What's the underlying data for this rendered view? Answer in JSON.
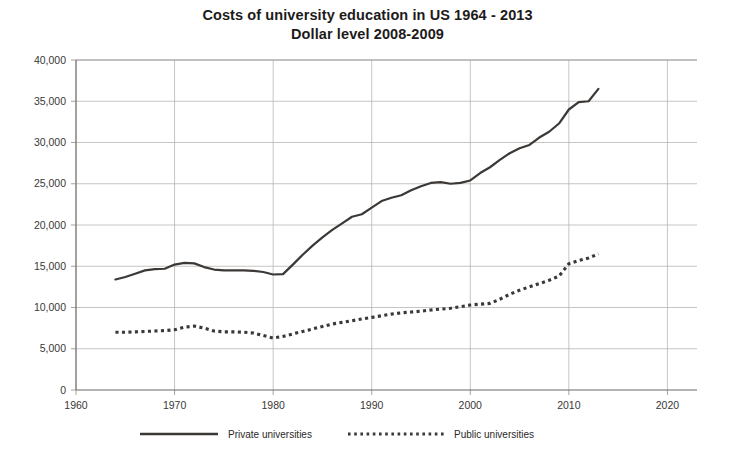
{
  "chart_data": {
    "type": "line",
    "title": "Costs of university education in US 1964 - 2013",
    "subtitle": "Dollar level 2008-2009",
    "xlabel": "",
    "ylabel": "",
    "xlim": [
      1960,
      2023
    ],
    "ylim": [
      0,
      40000
    ],
    "grid": true,
    "legend_position": "bottom",
    "x_ticks": [
      "1960",
      "1970",
      "1980",
      "1990",
      "2000",
      "2010",
      "2020"
    ],
    "x_tick_values": [
      1960,
      1970,
      1980,
      1990,
      2000,
      2010,
      2020
    ],
    "y_ticks": [
      "0",
      "5,000",
      "10,000",
      "15,000",
      "20,000",
      "25,000",
      "30,000",
      "35,000",
      "40,000"
    ],
    "y_tick_values": [
      0,
      5000,
      10000,
      15000,
      20000,
      25000,
      30000,
      35000,
      40000
    ],
    "series": [
      {
        "name": "Private universities",
        "style": "solid",
        "color": "#3b3836",
        "x": [
          1964,
          1965,
          1966,
          1967,
          1968,
          1969,
          1970,
          1971,
          1972,
          1973,
          1974,
          1975,
          1976,
          1977,
          1978,
          1979,
          1980,
          1981,
          1982,
          1983,
          1984,
          1985,
          1986,
          1987,
          1988,
          1989,
          1990,
          1991,
          1992,
          1993,
          1994,
          1995,
          1996,
          1997,
          1998,
          1999,
          2000,
          2001,
          2002,
          2003,
          2004,
          2005,
          2006,
          2007,
          2008,
          2009,
          2010,
          2011,
          2012,
          2013
        ],
        "values": [
          13400,
          13700,
          14100,
          14500,
          14650,
          14700,
          15200,
          15400,
          15350,
          14900,
          14600,
          14500,
          14500,
          14500,
          14450,
          14300,
          14000,
          14050,
          15200,
          16400,
          17500,
          18500,
          19400,
          20200,
          21000,
          21300,
          22100,
          22900,
          23300,
          23600,
          24200,
          24700,
          25100,
          25200,
          25000,
          25100,
          25400,
          26300,
          27000,
          27900,
          28700,
          29300,
          29700,
          30600,
          31300,
          32300,
          34000,
          34900,
          35000,
          36500
        ]
      },
      {
        "name": "Public universities",
        "style": "dotted",
        "color": "#3b3836",
        "x": [
          1964,
          1965,
          1966,
          1967,
          1968,
          1969,
          1970,
          1971,
          1972,
          1973,
          1974,
          1975,
          1976,
          1977,
          1978,
          1979,
          1980,
          1981,
          1982,
          1983,
          1984,
          1985,
          1986,
          1987,
          1988,
          1989,
          1990,
          1991,
          1992,
          1993,
          1994,
          1995,
          1996,
          1997,
          1998,
          1999,
          2000,
          2001,
          2002,
          2003,
          2004,
          2005,
          2006,
          2007,
          2008,
          2009,
          2010,
          2011,
          2012,
          2013
        ],
        "values": [
          7000,
          7000,
          7050,
          7100,
          7150,
          7200,
          7300,
          7600,
          7750,
          7500,
          7150,
          7050,
          7050,
          7000,
          6900,
          6600,
          6300,
          6500,
          6800,
          7100,
          7400,
          7700,
          8000,
          8200,
          8400,
          8600,
          8800,
          9000,
          9200,
          9350,
          9450,
          9550,
          9700,
          9800,
          9900,
          10100,
          10300,
          10400,
          10500,
          11000,
          11600,
          12100,
          12500,
          12900,
          13300,
          13800,
          15300,
          15700,
          16000,
          16500
        ]
      }
    ],
    "legend": [
      {
        "label": "Private universities",
        "style": "solid"
      },
      {
        "label": "Public universities",
        "style": "dotted"
      }
    ]
  }
}
